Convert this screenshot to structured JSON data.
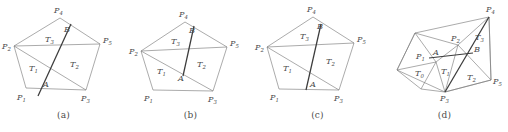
{
  "figure": {
    "background_color": "#ffffff",
    "line_color": "#7d7d7d",
    "emphasis_line_color": "#3c3c3c",
    "text_color": "#4a4a4a"
  },
  "panels": [
    {
      "id": "a",
      "caption": "(a)",
      "vertex_labels": [
        "P",
        "P",
        "P",
        "P",
        "P"
      ],
      "vertices": [
        {
          "name": "P1",
          "base": "P",
          "sub": "1",
          "x": 26,
          "y": 88,
          "label_x": 17,
          "label_y": 100
        },
        {
          "name": "P2",
          "base": "P",
          "sub": "2",
          "x": 14,
          "y": 46,
          "label_x": 3,
          "label_y": 49
        },
        {
          "name": "P3",
          "base": "P",
          "sub": "3",
          "x": 86,
          "y": 90,
          "label_x": 82,
          "label_y": 101
        },
        {
          "name": "P4",
          "base": "P",
          "sub": "4",
          "x": 60,
          "y": 18,
          "label_x": 54,
          "label_y": 13
        },
        {
          "name": "P5",
          "base": "P",
          "sub": "5",
          "x": 100,
          "y": 44,
          "label_x": 104,
          "label_y": 43
        }
      ],
      "points": [
        {
          "name": "A",
          "label": "A",
          "x": 47,
          "y": 79,
          "label_x": 44,
          "label_y": 86
        },
        {
          "name": "B",
          "base": "B",
          "x": 66,
          "y": 34,
          "label_x": 66,
          "label_y": 33
        }
      ],
      "triangle_labels": [
        {
          "name": "T1",
          "base": "T",
          "sub": "1",
          "label_x": 31,
          "label_y": 70
        },
        {
          "name": "T2",
          "base": "T",
          "sub": "2",
          "label_x": 72,
          "label_y": 66
        },
        {
          "name": "T3",
          "base": "T",
          "sub": "3",
          "label_x": 48,
          "label_y": 41
        }
      ]
    },
    {
      "id": "b",
      "caption": "(b)",
      "vertices": [
        {
          "name": "P1",
          "base": "P",
          "sub": "1",
          "x": 26,
          "y": 90,
          "label_x": 17,
          "label_y": 101
        },
        {
          "name": "P2",
          "base": "P",
          "sub": "2",
          "x": 14,
          "y": 51,
          "label_x": 3,
          "label_y": 54
        },
        {
          "name": "P3",
          "base": "P",
          "sub": "3",
          "x": 86,
          "y": 91,
          "label_x": 82,
          "label_y": 102
        },
        {
          "name": "P4",
          "base": "P",
          "sub": "4",
          "x": 58,
          "y": 22,
          "label_x": 52,
          "label_y": 17
        },
        {
          "name": "P5",
          "base": "P",
          "sub": "5",
          "x": 100,
          "y": 47,
          "label_x": 104,
          "label_y": 46
        }
      ],
      "points": [
        {
          "name": "A",
          "label": "A",
          "x": 56,
          "y": 80,
          "label_x": 52,
          "label_y": 80
        },
        {
          "name": "B",
          "base": "B",
          "x": 64,
          "y": 35,
          "label_x": 63,
          "label_y": 33
        }
      ],
      "triangle_labels": [
        {
          "name": "T1",
          "base": "T",
          "sub": "1",
          "label_x": 32,
          "label_y": 73
        },
        {
          "name": "T2",
          "base": "T",
          "sub": "2",
          "label_x": 72,
          "label_y": 66
        },
        {
          "name": "T3",
          "base": "T",
          "sub": "3",
          "label_x": 47,
          "label_y": 43
        }
      ]
    },
    {
      "id": "c",
      "caption": "(c)",
      "vertices": [
        {
          "name": "P1",
          "base": "P",
          "sub": "1",
          "x": 25,
          "y": 89,
          "label_x": 16,
          "label_y": 100
        },
        {
          "name": "P2",
          "base": "P",
          "sub": "2",
          "x": 13,
          "y": 47,
          "label_x": 2,
          "label_y": 50
        },
        {
          "name": "P3",
          "base": "P",
          "sub": "3",
          "x": 85,
          "y": 90,
          "label_x": 81,
          "label_y": 101
        },
        {
          "name": "P4",
          "base": "P",
          "sub": "4",
          "x": 59,
          "y": 17,
          "label_x": 53,
          "label_y": 12
        },
        {
          "name": "P5",
          "base": "P",
          "sub": "5",
          "x": 100,
          "y": 43,
          "label_x": 104,
          "label_y": 42
        }
      ],
      "points": [
        {
          "name": "A",
          "label": "A",
          "x": 54,
          "y": 87,
          "label_x": 57,
          "label_y": 86
        },
        {
          "name": "B",
          "base": "B",
          "x": 66,
          "y": 32,
          "label_x": 65,
          "label_y": 30
        }
      ],
      "triangle_labels": [
        {
          "name": "T1",
          "base": "T",
          "sub": "1",
          "label_x": 31,
          "label_y": 70
        },
        {
          "name": "T2",
          "base": "T",
          "sub": "2",
          "label_x": 74,
          "label_y": 63
        },
        {
          "name": "T3",
          "base": "T",
          "sub": "3",
          "label_x": 49,
          "label_y": 38
        }
      ]
    },
    {
      "id": "d",
      "caption": "(d)",
      "vertices": [
        {
          "name": "P1",
          "base": "P",
          "sub": "1",
          "x": 40,
          "y": 57,
          "label_x": 36,
          "label_y": 58
        },
        {
          "name": "P2",
          "base": "P",
          "sub": "2",
          "x": 77,
          "y": 42,
          "label_x": 71,
          "label_y": 41
        },
        {
          "name": "P3",
          "base": "P",
          "sub": "3",
          "x": 64,
          "y": 92,
          "label_x": 60,
          "label_y": 101
        },
        {
          "name": "P4",
          "base": "P",
          "sub": "4",
          "x": 108,
          "y": 17,
          "label_x": 107,
          "label_y": 12
        },
        {
          "name": "P5",
          "base": "P",
          "sub": "5",
          "x": 110,
          "y": 80,
          "label_x": 112,
          "label_y": 84
        }
      ],
      "points": [
        {
          "name": "A",
          "label": "A",
          "x": 55,
          "y": 54,
          "label_x": 53,
          "label_y": 54
        },
        {
          "name": "B",
          "base": "B",
          "x": 91,
          "y": 53,
          "label_x": 93,
          "label_y": 52
        }
      ],
      "triangle_labels": [
        {
          "name": "T0",
          "base": "T",
          "sub": "0",
          "label_x": 37,
          "label_y": 75
        },
        {
          "name": "T1",
          "base": "T",
          "sub": "1",
          "label_x": 63,
          "label_y": 73
        },
        {
          "name": "T2",
          "base": "T",
          "sub": "2",
          "label_x": 89,
          "label_y": 79
        },
        {
          "name": "T3",
          "base": "T",
          "sub": "3",
          "label_x": 96,
          "label_y": 40
        }
      ]
    }
  ]
}
